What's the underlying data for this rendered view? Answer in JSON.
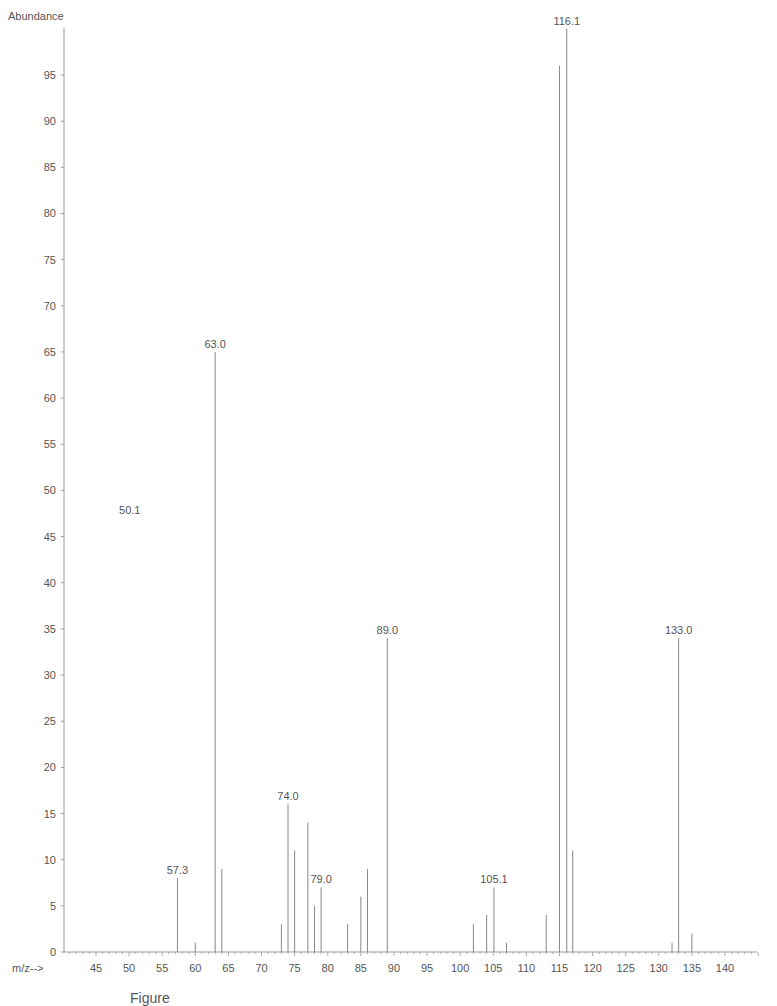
{
  "chart_data": {
    "type": "bar",
    "subtype": "mass-spectrum-stick",
    "title": "",
    "ylabel": "Abundance",
    "xlabel": "m/z-->",
    "xlim": [
      40,
      146
    ],
    "ylim": [
      0,
      100
    ],
    "x_ticks": [
      45,
      50,
      55,
      60,
      65,
      70,
      75,
      80,
      85,
      90,
      95,
      100,
      105,
      110,
      115,
      120,
      125,
      130,
      135,
      140
    ],
    "y_ticks": [
      0,
      5,
      10,
      15,
      20,
      25,
      30,
      35,
      40,
      45,
      50,
      55,
      60,
      65,
      70,
      75,
      80,
      85,
      90,
      95
    ],
    "grid": false,
    "legend": null,
    "peaks": [
      {
        "mz": 57.3,
        "abundance": 8,
        "label": "57.3"
      },
      {
        "mz": 60,
        "abundance": 1
      },
      {
        "mz": 63.0,
        "abundance": 65,
        "label": "63.0"
      },
      {
        "mz": 64,
        "abundance": 9
      },
      {
        "mz": 73,
        "abundance": 3
      },
      {
        "mz": 74.0,
        "abundance": 16,
        "label": "74.0"
      },
      {
        "mz": 75,
        "abundance": 11
      },
      {
        "mz": 77,
        "abundance": 14
      },
      {
        "mz": 78,
        "abundance": 5
      },
      {
        "mz": 79.0,
        "abundance": 7,
        "label": "79.0"
      },
      {
        "mz": 83,
        "abundance": 3
      },
      {
        "mz": 85,
        "abundance": 6
      },
      {
        "mz": 86,
        "abundance": 9
      },
      {
        "mz": 89.0,
        "abundance": 34,
        "label": "89.0"
      },
      {
        "mz": 102,
        "abundance": 3
      },
      {
        "mz": 104,
        "abundance": 4
      },
      {
        "mz": 105.1,
        "abundance": 7,
        "label": "105.1"
      },
      {
        "mz": 107,
        "abundance": 1
      },
      {
        "mz": 113,
        "abundance": 4
      },
      {
        "mz": 115,
        "abundance": 96
      },
      {
        "mz": 116.1,
        "abundance": 100,
        "label": "116.1"
      },
      {
        "mz": 117,
        "abundance": 11
      },
      {
        "mz": 132,
        "abundance": 1
      },
      {
        "mz": 133.0,
        "abundance": 34,
        "label": "133.0"
      },
      {
        "mz": 135,
        "abundance": 2
      }
    ],
    "annotations": [
      {
        "text": "50.1",
        "mz": 50.1,
        "abundance": 47.5,
        "note": "label without visible peak"
      }
    ]
  },
  "labels": {
    "y_axis_title": "Abundance",
    "x_axis_title": "m/z-->",
    "caption": "Figure"
  }
}
